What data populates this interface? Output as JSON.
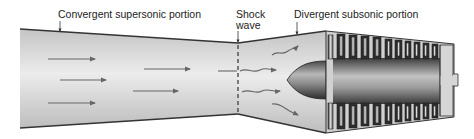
{
  "diagram": {
    "type": "cross-section",
    "labels": {
      "convergent": "Convergent supersonic portion",
      "shock_line1": "Shock",
      "shock_line2": "wave",
      "divergent": "Divergent subsonic portion"
    },
    "components": [
      {
        "id": "convergent-duct",
        "label": "Convergent supersonic portion"
      },
      {
        "id": "shock-wave",
        "label": "Shock wave"
      },
      {
        "id": "divergent-duct",
        "label": "Divergent subsonic portion"
      },
      {
        "id": "inlet-cone"
      },
      {
        "id": "compressor"
      }
    ],
    "flow": {
      "supersonic_arrows": 6,
      "subsonic_wavy_arrows": 4
    },
    "colors": {
      "duct_fill": "#d4d4d4",
      "duct_highlight": "#eeeeee",
      "outline": "#333333",
      "arrow": "#666666",
      "compressor_dark": "#3a3a3a",
      "compressor_light": "#cfcfcf"
    }
  }
}
